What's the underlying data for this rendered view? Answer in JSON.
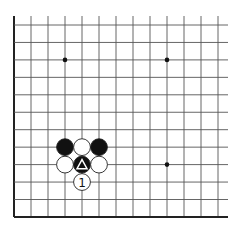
{
  "board": {
    "origin_x": 14,
    "origin_y": 25,
    "spacing_x": 17.0,
    "spacing_y": 17.45,
    "cols": 13,
    "rows": 12,
    "open_top": true,
    "open_right": true,
    "edge_left": true,
    "edge_bottom": true,
    "line_color": "#555555",
    "edge_color": "#222222"
  },
  "star_points": [
    {
      "col": 3,
      "row": 2
    },
    {
      "col": 9,
      "row": 2
    },
    {
      "col": 9,
      "row": 8
    }
  ],
  "stones": [
    {
      "col": 3,
      "row": 7,
      "color": "black",
      "mark": ""
    },
    {
      "col": 4,
      "row": 7,
      "color": "white",
      "mark": ""
    },
    {
      "col": 5,
      "row": 7,
      "color": "black",
      "mark": ""
    },
    {
      "col": 3,
      "row": 8,
      "color": "white",
      "mark": ""
    },
    {
      "col": 4,
      "row": 8,
      "color": "black",
      "mark": "triangle"
    },
    {
      "col": 5,
      "row": 8,
      "color": "white",
      "mark": ""
    },
    {
      "col": 4,
      "row": 9,
      "color": "white",
      "mark": "1"
    }
  ]
}
